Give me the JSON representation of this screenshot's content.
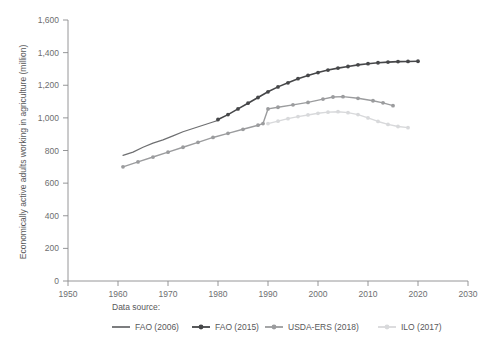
{
  "chart_data": {
    "type": "line",
    "title": "",
    "subtitle": "",
    "xlabel": "",
    "ylabel": "Economically active adults working in agriculture (million)",
    "xlim": [
      1950,
      2030
    ],
    "ylim": [
      0,
      1600
    ],
    "xticks": [
      1950,
      1960,
      1970,
      1980,
      1990,
      2000,
      2010,
      2020,
      2030
    ],
    "xtick_labels": [
      "1950",
      "1960",
      "1970",
      "1980",
      "1990",
      "2000",
      "2010",
      "2020",
      "2030"
    ],
    "yticks": [
      0,
      200,
      400,
      600,
      800,
      1000,
      1200,
      1400,
      1600
    ],
    "ytick_labels": [
      "0",
      "200",
      "400",
      "600",
      "800",
      "1,000",
      "1,200",
      "1,400",
      "1,600"
    ],
    "grid": false,
    "legend_position": "bottom",
    "legend_title": "Data source:",
    "series": [
      {
        "name": "FAO (2006)",
        "color": "#6e6f71",
        "marker": "none",
        "linewidth": 1.2,
        "x": [
          1961,
          1963,
          1965,
          1967,
          1969,
          1971,
          1973,
          1975,
          1977,
          1979,
          1980
        ],
        "values": [
          770,
          790,
          820,
          845,
          865,
          890,
          915,
          935,
          955,
          975,
          985
        ]
      },
      {
        "name": "FAO (2015)",
        "color": "#464749",
        "marker": "circle",
        "linewidth": 1.6,
        "x": [
          1980,
          1982,
          1984,
          1986,
          1988,
          1990,
          1992,
          1994,
          1996,
          1998,
          2000,
          2002,
          2004,
          2006,
          2008,
          2010,
          2012,
          2014,
          2016,
          2018,
          2020
        ],
        "values": [
          990,
          1020,
          1055,
          1090,
          1125,
          1160,
          1190,
          1215,
          1240,
          1260,
          1278,
          1293,
          1305,
          1315,
          1325,
          1332,
          1338,
          1342,
          1345,
          1346,
          1347
        ]
      },
      {
        "name": "USDA-ERS (2018)",
        "color": "#9b9c9e",
        "marker": "circle",
        "linewidth": 1.4,
        "x": [
          1961,
          1964,
          1967,
          1970,
          1973,
          1976,
          1979,
          1982,
          1985,
          1988,
          1989,
          1990,
          1992,
          1995,
          1998,
          2001,
          2003,
          2005,
          2008,
          2011,
          2013,
          2015
        ],
        "values": [
          700,
          730,
          760,
          790,
          820,
          850,
          880,
          905,
          930,
          955,
          965,
          1055,
          1065,
          1080,
          1095,
          1115,
          1128,
          1130,
          1120,
          1105,
          1092,
          1075
        ]
      },
      {
        "name": "ILO (2017)",
        "color": "#d8d9db",
        "marker": "circle",
        "linewidth": 1.4,
        "x": [
          1990,
          1992,
          1994,
          1996,
          1998,
          2000,
          2002,
          2004,
          2006,
          2008,
          2010,
          2012,
          2014,
          2016,
          2018
        ],
        "values": [
          965,
          980,
          995,
          1008,
          1018,
          1028,
          1035,
          1038,
          1032,
          1020,
          1000,
          978,
          960,
          947,
          940
        ]
      }
    ]
  },
  "axes": {
    "y_axis_title": "Economically active adults working in agriculture (million)"
  },
  "legend": {
    "title": "Data source:",
    "items": [
      {
        "label": "FAO (2006)",
        "color": "#6e6f71",
        "marker": "none"
      },
      {
        "label": "FAO (2015)",
        "color": "#464749",
        "marker": "circle"
      },
      {
        "label": "USDA-ERS (2018)",
        "color": "#9b9c9e",
        "marker": "circle"
      },
      {
        "label": "ILO (2017)",
        "color": "#d8d9db",
        "marker": "circle"
      }
    ]
  }
}
